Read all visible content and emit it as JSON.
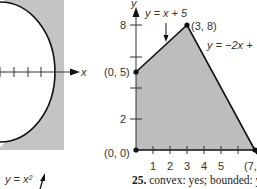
{
  "left_figure": {
    "x_axis_label": "x",
    "curve_label": "y = x²"
  },
  "right_figure": {
    "y_axis_label": "y",
    "line1_label": "y = x + 5",
    "line2_label": "y = −2x +",
    "points": [
      {
        "label": "(0, 5)",
        "x": 0,
        "y": 5
      },
      {
        "label": "(3, 8)",
        "x": 3,
        "y": 8
      },
      {
        "label": "(0, 0)",
        "x": 0,
        "y": 0
      },
      {
        "label": "(7,",
        "x": 7,
        "y": 0
      }
    ],
    "x_ticks": [
      "1",
      "2",
      "3",
      "4",
      "5"
    ],
    "y_ticks": [
      "8",
      "2"
    ]
  },
  "caption": {
    "number": "25.",
    "text": "convex: yes; bounded: yes;"
  }
}
